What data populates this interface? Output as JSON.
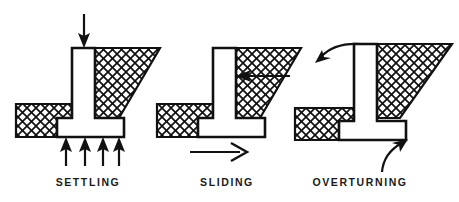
{
  "figure": {
    "background_color": "#ffffff",
    "line_color": "#111111",
    "hatch_color": "#111111",
    "fill_color": "#ffffff"
  },
  "panels": [
    {
      "id": "settling",
      "caption": "SETTLING",
      "caption_x": 88,
      "caption_y": 186,
      "icon_name": "retaining-wall-settling-icon",
      "load_arrow": {
        "name": "downward-load-arrow",
        "direction": "down",
        "count": 1
      },
      "reaction_arrows": {
        "name": "upward-soil-reaction-arrows",
        "direction": "up",
        "count": 4,
        "x_positions": [
          66,
          85,
          103,
          119
        ]
      }
    },
    {
      "id": "sliding",
      "caption": "SLIDING",
      "caption_x": 227,
      "caption_y": 186,
      "icon_name": "retaining-wall-sliding-icon",
      "lateral_arrow": {
        "name": "lateral-earth-pressure-arrow",
        "direction": "left",
        "count": 1
      },
      "motion_arrow": {
        "name": "sliding-motion-arrow",
        "direction": "right",
        "count": 1
      }
    },
    {
      "id": "overturning",
      "caption": "OVERTURNING",
      "caption_x": 360,
      "caption_y": 186,
      "icon_name": "retaining-wall-overturning-icon",
      "rotation_arrow_top": {
        "name": "overturning-rotation-arrow",
        "direction": "curved-left",
        "count": 1
      },
      "toe_arrow": {
        "name": "toe-pivot-arrow",
        "direction": "curved-up",
        "count": 1
      }
    }
  ]
}
